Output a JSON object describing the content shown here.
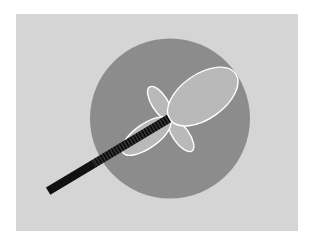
{
  "figure": {
    "colors": {
      "page": "#ffffff",
      "panel": "#d5d5d5",
      "coverage_disc": "#8c8c8c",
      "lobe_fill": "#b9b9b9",
      "lobe_outline": "#ffffff",
      "feed_solid": "#111111",
      "feed_striped_base": "#333333",
      "feed_stripe": "#0a0a0a"
    },
    "lobes": [
      {
        "name": "main-lobe",
        "direction_deg": 35,
        "relative_length": 1.0,
        "relative_width": 0.56
      },
      {
        "name": "side-lobe-upper-left",
        "direction_deg": 122,
        "relative_length": 0.48,
        "relative_width": 0.42
      },
      {
        "name": "side-lobe-lower-right",
        "direction_deg": -55,
        "relative_length": 0.48,
        "relative_width": 0.42
      },
      {
        "name": "back-lobe",
        "direction_deg": 215,
        "relative_length": 0.72,
        "relative_width": 0.42
      }
    ],
    "feed": {
      "direction_deg": 211,
      "striped_fraction": 0.62
    }
  }
}
